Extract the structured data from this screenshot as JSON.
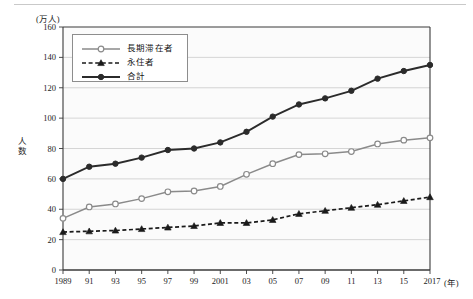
{
  "figure": {
    "unit_label": "(万人)",
    "y_axis_title": "人数",
    "x_axis_unit": "(年)"
  },
  "legend": {
    "items": [
      {
        "label": "長期滞在者",
        "style": "solid-open-circle",
        "color": "#8a8a8a"
      },
      {
        "label": "永住者",
        "style": "dashed-filled-triangle",
        "color": "#1a1a1a"
      },
      {
        "label": "合計",
        "style": "solid-filled-circle",
        "color": "#2b2b2b"
      }
    ]
  },
  "chart_data": {
    "type": "line",
    "title": "",
    "subtitle": "",
    "xlabel": "(年)",
    "ylabel": "人数",
    "unit": "万人",
    "grid": true,
    "legend_position": "top-left-inside",
    "xlim": [
      1989,
      2017
    ],
    "ylim": [
      0,
      160
    ],
    "ytick_step": 20,
    "yticks": [
      0,
      20,
      40,
      60,
      80,
      100,
      120,
      140,
      160
    ],
    "x": [
      1989,
      1991,
      1993,
      1995,
      1997,
      1999,
      2001,
      2003,
      2005,
      2007,
      2009,
      2011,
      2013,
      2015,
      2017
    ],
    "categories": [
      "1989",
      "91",
      "93",
      "95",
      "97",
      "99",
      "2001",
      "03",
      "05",
      "07",
      "09",
      "11",
      "13",
      "15",
      "2017"
    ],
    "series": [
      {
        "name": "長期滞在者",
        "color": "#8a8a8a",
        "line": "solid",
        "marker": "open-circle",
        "values": [
          34,
          41.5,
          43.5,
          47,
          51.5,
          52,
          55,
          63,
          70,
          76,
          76.5,
          78,
          83,
          85.5,
          87
        ]
      },
      {
        "name": "永住者",
        "color": "#1a1a1a",
        "line": "dashed",
        "marker": "filled-triangle",
        "values": [
          25,
          25.5,
          26,
          27,
          28,
          29,
          31,
          31,
          33,
          37,
          39,
          41,
          43,
          45.5,
          48
        ]
      },
      {
        "name": "合計",
        "color": "#2b2b2b",
        "line": "solid",
        "marker": "filled-circle",
        "values": [
          60,
          68,
          70,
          74,
          79,
          80,
          84,
          91,
          101,
          109,
          113,
          118,
          126,
          131,
          135
        ]
      }
    ]
  }
}
